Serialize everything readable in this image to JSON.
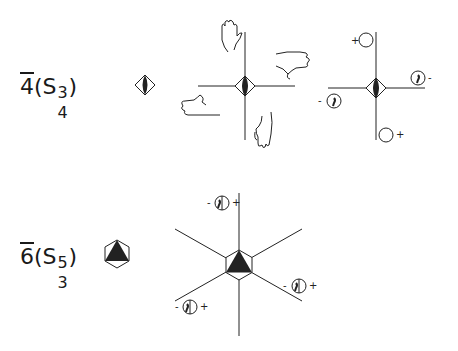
{
  "rows": [
    {
      "id": "s4",
      "label": {
        "main": "4",
        "open": "(S",
        "sup": "3",
        "sub": "4",
        "close": ")"
      },
      "symbol": "bar-4-diamond-with-filled-lens",
      "hands_diagram": {
        "hands": [
          "hand-top-palm-up",
          "hand-right-pointing-right",
          "hand-left-pointing-left",
          "hand-bottom-pointing-down"
        ]
      },
      "stereogram": {
        "points": [
          {
            "position": "top",
            "sign": "+",
            "type": "open-circle"
          },
          {
            "position": "right",
            "sign": "-",
            "type": "comma-circle"
          },
          {
            "position": "left",
            "sign": "-",
            "type": "comma-circle"
          },
          {
            "position": "bottom",
            "sign": "+",
            "type": "open-circle"
          }
        ]
      }
    },
    {
      "id": "s6",
      "label": {
        "main": "6",
        "open": "(S",
        "sup": "5",
        "sub": "3",
        "close": ")"
      },
      "symbol": "bar-6-hexagon-with-filled-triangle",
      "stereogram": {
        "points": [
          {
            "position": "top",
            "left_sign": "-",
            "right_sign": "+",
            "type": "split-circle"
          },
          {
            "position": "lower-right",
            "left_sign": "-",
            "right_sign": "+",
            "type": "split-circle"
          },
          {
            "position": "lower-left",
            "left_sign": "-",
            "right_sign": "+",
            "type": "split-circle"
          }
        ]
      }
    }
  ],
  "signs": {
    "plus": "+",
    "minus": "−"
  }
}
